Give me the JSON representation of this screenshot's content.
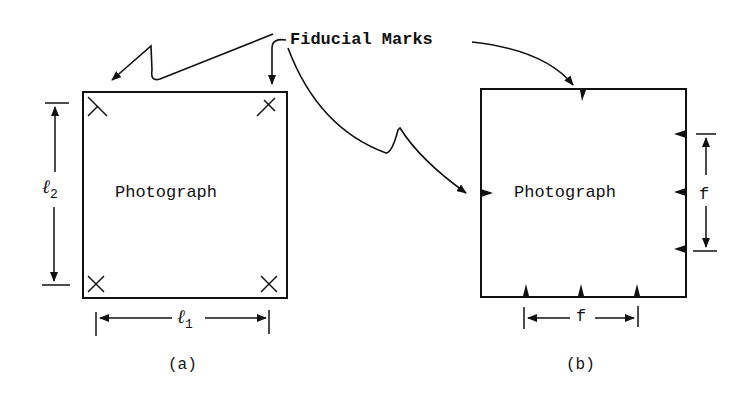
{
  "diagram": {
    "callout_label": "Fiducial Marks",
    "panel_a": {
      "caption": "(a)",
      "photo_label": "Photograph",
      "mark_type": "corner-cross",
      "dim_horizontal": {
        "symbol": "ℓ",
        "subscript": "1"
      },
      "dim_vertical": {
        "symbol": "ℓ",
        "subscript": "2"
      }
    },
    "panel_b": {
      "caption": "(b)",
      "photo_label": "Photograph",
      "mark_type": "side-triangle",
      "dim_horizontal": {
        "symbol": "f"
      },
      "dim_vertical": {
        "symbol": "f"
      }
    },
    "colors": {
      "ink": "#111111",
      "background": "#ffffff"
    }
  }
}
